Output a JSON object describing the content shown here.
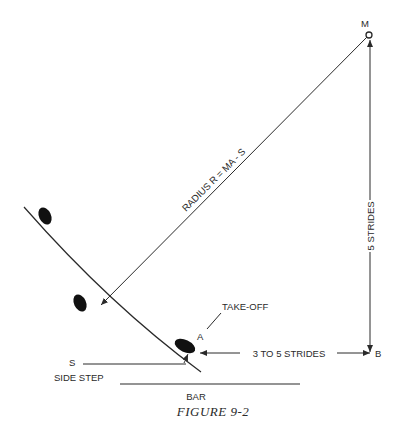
{
  "figure": {
    "caption": "FIGURE 9-2",
    "labels": {
      "center_point": "M",
      "radius": "RADIUS R = MA - S",
      "vertical_distance": "5 STRIDES",
      "horizontal_distance": "3 TO 5 STRIDES",
      "point_b": "B",
      "point_a": "A",
      "take_off": "TAKE-OFF",
      "point_s": "S",
      "side_step": "SIDE STEP",
      "bar": "BAR"
    },
    "colors": {
      "ink": "#2a2a2a",
      "background": "#ffffff"
    }
  }
}
